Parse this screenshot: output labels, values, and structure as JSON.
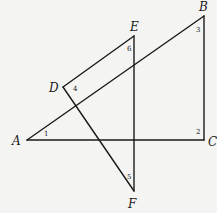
{
  "diagram": {
    "type": "geometry-figure",
    "points": {
      "A": {
        "x": 27,
        "y": 140
      },
      "B": {
        "x": 204,
        "y": 16
      },
      "C": {
        "x": 204,
        "y": 140
      },
      "D": {
        "x": 63,
        "y": 87
      },
      "E": {
        "x": 134,
        "y": 36
      },
      "F": {
        "x": 134,
        "y": 191
      }
    },
    "segments": [
      {
        "from": "A",
        "to": "B"
      },
      {
        "from": "B",
        "to": "C"
      },
      {
        "from": "A",
        "to": "C"
      },
      {
        "from": "D",
        "to": "E"
      },
      {
        "from": "E",
        "to": "F"
      },
      {
        "from": "D",
        "to": "F"
      }
    ],
    "vertex_labels": [
      {
        "id": "A",
        "text": "A",
        "x": 12,
        "y": 145
      },
      {
        "id": "B",
        "text": "B",
        "x": 199,
        "y": 11
      },
      {
        "id": "C",
        "text": "C",
        "x": 208,
        "y": 146
      },
      {
        "id": "D",
        "text": "D",
        "x": 49,
        "y": 92
      },
      {
        "id": "E",
        "text": "E",
        "x": 130,
        "y": 31
      },
      {
        "id": "F",
        "text": "F",
        "x": 128,
        "y": 208
      }
    ],
    "angle_labels": [
      {
        "id": "1",
        "text": "1",
        "x": 44,
        "y": 136
      },
      {
        "id": "2",
        "text": "2",
        "x": 196,
        "y": 134
      },
      {
        "id": "3",
        "text": "3",
        "x": 196,
        "y": 32
      },
      {
        "id": "4",
        "text": "4",
        "x": 73,
        "y": 91
      },
      {
        "id": "5",
        "text": "5",
        "x": 127,
        "y": 179
      },
      {
        "id": "6",
        "text": "6",
        "x": 127,
        "y": 51
      }
    ]
  }
}
